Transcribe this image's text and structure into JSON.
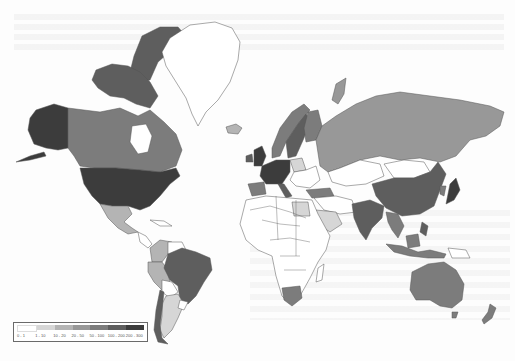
{
  "map": {
    "type": "choropleth",
    "projection": "mercator",
    "style": "grayscale, scanned book page",
    "legend": {
      "items": [
        {
          "label": "0 - 1",
          "color": "#ffffff"
        },
        {
          "label": "1 - 10",
          "color": "#d6d6d6"
        },
        {
          "label": "10 - 20",
          "color": "#b4b4b4"
        },
        {
          "label": "20 - 50",
          "color": "#989898"
        },
        {
          "label": "50 - 100",
          "color": "#7c7c7c"
        },
        {
          "label": "100 - 200",
          "color": "#5e5e5e"
        },
        {
          "label": "200 - 300",
          "color": "#3c3c3c"
        }
      ]
    },
    "colors": {
      "background": "#fdfdfd",
      "border": "#555555",
      "class_0": "#ffffff",
      "class_1": "#d6d6d6",
      "class_2": "#b4b4b4",
      "class_3": "#989898",
      "class_4": "#7c7c7c",
      "class_5": "#5e5e5e",
      "class_6": "#3c3c3c"
    },
    "regions": [
      {
        "name": "United States",
        "class": "200 - 300"
      },
      {
        "name": "Alaska",
        "class": "200 - 300"
      },
      {
        "name": "Canada",
        "class": "50 - 100"
      },
      {
        "name": "Canadian Arctic Archipelago",
        "class": "100 - 200"
      },
      {
        "name": "Greenland",
        "class": "0 - 1"
      },
      {
        "name": "Mexico",
        "class": "10 - 20"
      },
      {
        "name": "Brazil",
        "class": "100 - 200"
      },
      {
        "name": "Argentina",
        "class": "10 - 20"
      },
      {
        "name": "Chile",
        "class": "100 - 200"
      },
      {
        "name": "Peru",
        "class": "10 - 20"
      },
      {
        "name": "Colombia",
        "class": "10 - 20"
      },
      {
        "name": "Russia",
        "class": "20 - 50"
      },
      {
        "name": "China",
        "class": "100 - 200"
      },
      {
        "name": "India",
        "class": "100 - 200"
      },
      {
        "name": "Japan",
        "class": "200 - 300"
      },
      {
        "name": "Australia",
        "class": "50 - 100"
      },
      {
        "name": "New Zealand",
        "class": "50 - 100"
      },
      {
        "name": "South Africa",
        "class": "50 - 100"
      },
      {
        "name": "Egypt",
        "class": "1 - 10"
      },
      {
        "name": "Saudi Arabia",
        "class": "1 - 10"
      },
      {
        "name": "Turkey",
        "class": "50 - 100"
      },
      {
        "name": "Norway",
        "class": "50 - 100"
      },
      {
        "name": "Sweden",
        "class": "100 - 200"
      },
      {
        "name": "Finland",
        "class": "50 - 100"
      },
      {
        "name": "United Kingdom",
        "class": "200 - 300"
      },
      {
        "name": "Western Europe",
        "class": "200 - 300"
      },
      {
        "name": "Poland",
        "class": "10 - 20"
      },
      {
        "name": "Spain",
        "class": "50 - 100"
      },
      {
        "name": "Kazakhstan",
        "class": "0 - 1"
      },
      {
        "name": "Mongolia",
        "class": "0 - 1"
      },
      {
        "name": "Southeast Asia",
        "class": "50 - 100"
      },
      {
        "name": "Africa (most)",
        "class": "0 - 1"
      }
    ]
  }
}
